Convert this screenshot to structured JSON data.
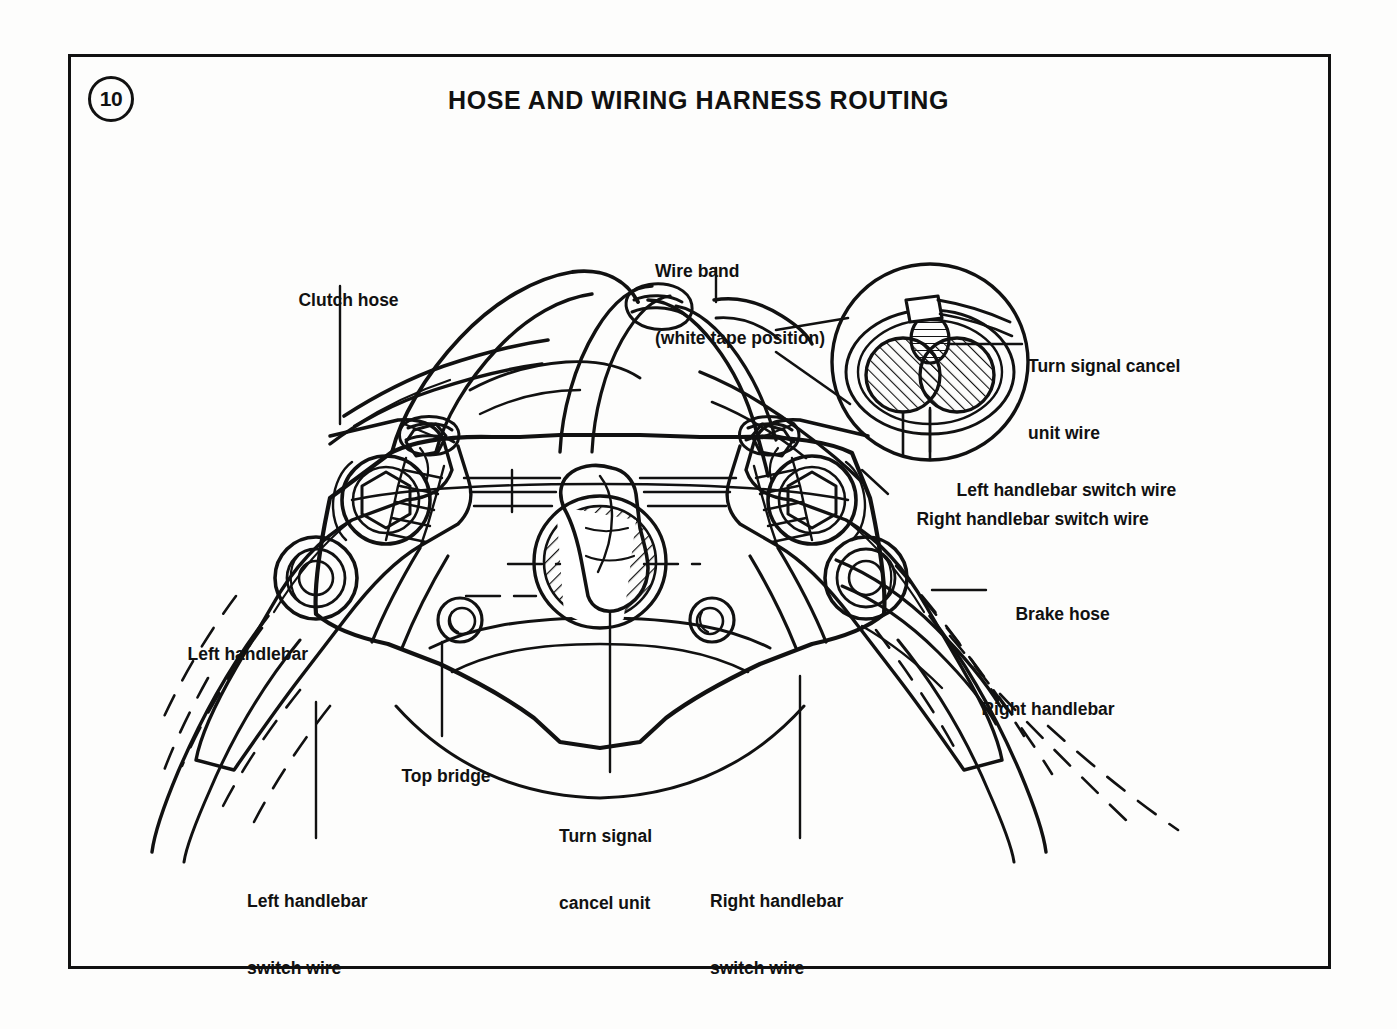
{
  "page": {
    "number": "10",
    "title": "HOSE AND WIRING HARNESS ROUTING",
    "background_color": "#fdfdfc",
    "line_color": "#111111"
  },
  "diagram": {
    "view": "front-top perspective line drawing",
    "detail_callout": {
      "name": "wire-band-cross-section",
      "shape": "circle",
      "contents": "Wire band (white tape) clamped around three wires: turn signal cancel unit wire above, left handlebar switch wire and right handlebar switch wire below"
    },
    "labels": [
      {
        "id": "clutch-hose",
        "text": "Clutch hose",
        "x": 279,
        "y": 268,
        "leader": "vertical down to clutch hose at top bridge"
      },
      {
        "id": "wire-band",
        "text": "Wire band",
        "text_line2": "(white tape position)",
        "x": 655,
        "y": 215,
        "leader": "vertical down to wire band on harness"
      },
      {
        "id": "turn-signal-cancel-unit-wire",
        "text": "Turn signal cancel",
        "text_line2": "unit wire",
        "x": 1028,
        "y": 310,
        "leader": "horizontal left into detail circle"
      },
      {
        "id": "left-handlebar-switch-wire-detail",
        "text": "Left handlebar switch wire",
        "x": 937,
        "y": 458,
        "leader": "vertical up into detail circle"
      },
      {
        "id": "right-handlebar-switch-wire-detail",
        "text": "Right handlebar switch wire",
        "x": 897,
        "y": 487,
        "leader": "diagonal up into detail circle"
      },
      {
        "id": "brake-hose",
        "text": "Brake hose",
        "x": 996,
        "y": 582,
        "leader": "horizontal left to brake hose"
      },
      {
        "id": "right-handlebar",
        "text": "Right handlebar",
        "x": 962,
        "y": 677,
        "leader": "none"
      },
      {
        "id": "left-handlebar",
        "text": "Left handlebar",
        "x": 168,
        "y": 622,
        "leader": "none"
      },
      {
        "id": "top-bridge",
        "text": "Top bridge",
        "x": 382,
        "y": 744,
        "leader": "vertical up to top bridge casting"
      },
      {
        "id": "turn-signal-cancel-unit",
        "text": "Turn signal",
        "text_line2": "cancel unit",
        "x": 559,
        "y": 780,
        "leader": "vertical up to cancel unit"
      },
      {
        "id": "left-handlebar-switch-wire",
        "text": "Left handlebar",
        "text_line2": "switch wire",
        "x": 247,
        "y": 845,
        "leader": "vertical up to left switch wire"
      },
      {
        "id": "right-handlebar-switch-wire",
        "text": "Right handlebar",
        "text_line2": "switch wire",
        "x": 710,
        "y": 845,
        "leader": "vertical up to right switch wire"
      }
    ]
  }
}
